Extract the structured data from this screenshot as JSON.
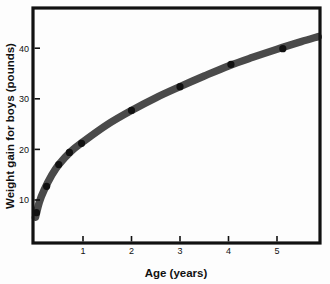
{
  "chart_data": {
    "type": "line",
    "title": "",
    "xlabel": "Age (years)",
    "ylabel": "Weight gain for boys (pounds)",
    "xlim": [
      0,
      5.9
    ],
    "ylim": [
      0,
      46
    ],
    "xticks": [
      1,
      2,
      3,
      4,
      5
    ],
    "yticks": [
      10,
      20,
      30,
      40
    ],
    "xtick_labels": [
      "1",
      "2",
      "3",
      "4",
      "5"
    ],
    "ytick_labels": [
      "10",
      "20",
      "30",
      "40"
    ],
    "grid": false,
    "legend": "none",
    "series": [
      {
        "name": "Weight gain for boys",
        "marker": "filled-circle",
        "marker_color": "#111111",
        "band_color": "#4a4a4a",
        "points": [
          {
            "x": 0.04,
            "y": 7.5
          },
          {
            "x": 0.25,
            "y": 12.7
          },
          {
            "x": 0.5,
            "y": 17.0
          },
          {
            "x": 0.72,
            "y": 19.4
          },
          {
            "x": 0.97,
            "y": 21.2
          },
          {
            "x": 2.0,
            "y": 27.7
          },
          {
            "x": 3.0,
            "y": 32.4
          },
          {
            "x": 4.05,
            "y": 36.8
          },
          {
            "x": 5.12,
            "y": 39.9
          }
        ],
        "curve": [
          {
            "x": 0.02,
            "y": 6.6
          },
          {
            "x": 0.1,
            "y": 9.6
          },
          {
            "x": 0.2,
            "y": 12.0
          },
          {
            "x": 0.35,
            "y": 14.8
          },
          {
            "x": 0.5,
            "y": 17.0
          },
          {
            "x": 0.75,
            "y": 19.6
          },
          {
            "x": 1.0,
            "y": 21.5
          },
          {
            "x": 1.5,
            "y": 24.9
          },
          {
            "x": 2.0,
            "y": 27.7
          },
          {
            "x": 2.5,
            "y": 30.2
          },
          {
            "x": 3.0,
            "y": 32.4
          },
          {
            "x": 3.5,
            "y": 34.5
          },
          {
            "x": 4.0,
            "y": 36.5
          },
          {
            "x": 4.5,
            "y": 38.2
          },
          {
            "x": 5.0,
            "y": 39.8
          },
          {
            "x": 5.5,
            "y": 41.3
          },
          {
            "x": 5.85,
            "y": 42.3
          }
        ]
      }
    ]
  },
  "figure": {
    "frame_color": "#111111",
    "background": "#fdfdfd"
  }
}
